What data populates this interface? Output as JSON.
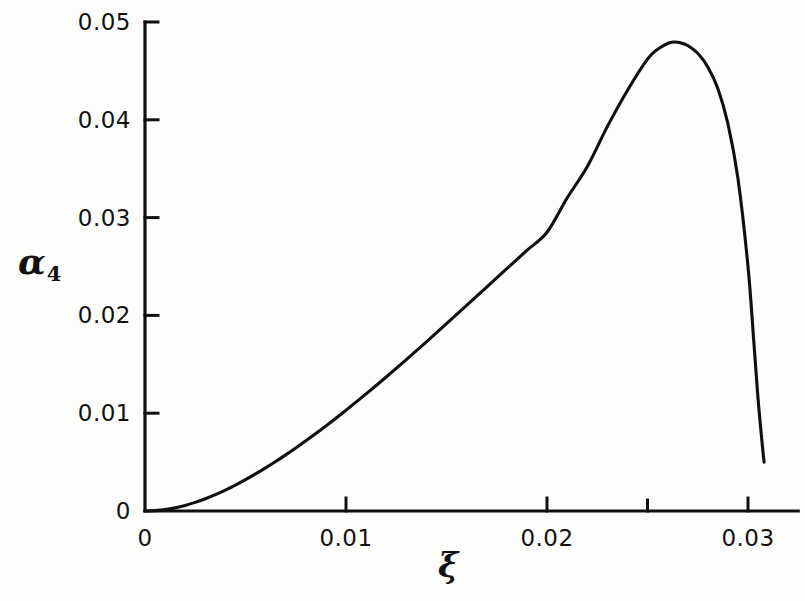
{
  "chart_data": {
    "type": "line",
    "title": "",
    "subtitle": "",
    "xlabel": "ξ",
    "ylabel": "α₄",
    "xlim": [
      0,
      0.0325
    ],
    "ylim": [
      0,
      0.05
    ],
    "grid": false,
    "legend": null,
    "x_ticks": [
      {
        "value": 0,
        "label": "0",
        "major": true
      },
      {
        "value": 0.01,
        "label": "0.01",
        "major": true
      },
      {
        "value": 0.02,
        "label": "0.02",
        "major": true
      },
      {
        "value": 0.025,
        "label": "",
        "major": false
      },
      {
        "value": 0.03,
        "label": "0.03",
        "major": true
      }
    ],
    "y_ticks": [
      {
        "value": 0,
        "label": "0",
        "major": true
      },
      {
        "value": 0.01,
        "label": "0.01",
        "major": true
      },
      {
        "value": 0.02,
        "label": "0.02",
        "major": true
      },
      {
        "value": 0.03,
        "label": "0.03",
        "major": true
      },
      {
        "value": 0.04,
        "label": "0.04",
        "major": true
      },
      {
        "value": 0.05,
        "label": "0.05",
        "major": true
      }
    ],
    "series": [
      {
        "name": "alpha_4",
        "x": [
          0.0,
          0.0005,
          0.001,
          0.0015,
          0.002,
          0.0025,
          0.003,
          0.0035,
          0.004,
          0.0045,
          0.005,
          0.0055,
          0.006,
          0.0065,
          0.007,
          0.0075,
          0.008,
          0.0085,
          0.009,
          0.0095,
          0.01,
          0.011,
          0.012,
          0.013,
          0.014,
          0.015,
          0.016,
          0.017,
          0.018,
          0.019,
          0.02,
          0.021,
          0.022,
          0.023,
          0.024,
          0.025,
          0.0255,
          0.026,
          0.0263,
          0.0266,
          0.027,
          0.0275,
          0.028,
          0.0285,
          0.029,
          0.0295,
          0.03,
          0.0303,
          0.0305,
          0.0307,
          0.0308
        ],
        "y": [
          0.0,
          4e-05,
          0.00014,
          0.00032,
          0.00057,
          0.00088,
          0.00125,
          0.00167,
          0.00214,
          0.00265,
          0.0032,
          0.00379,
          0.00441,
          0.00506,
          0.00574,
          0.00645,
          0.00718,
          0.00793,
          0.0087,
          0.00949,
          0.0103,
          0.01197,
          0.0137,
          0.01548,
          0.0173,
          0.01915,
          0.02102,
          0.0229,
          0.02478,
          0.02665,
          0.0285,
          0.032,
          0.0352,
          0.0393,
          0.043,
          0.0462,
          0.0472,
          0.0478,
          0.04795,
          0.0479,
          0.0476,
          0.0468,
          0.0454,
          0.0432,
          0.0396,
          0.034,
          0.025,
          0.017,
          0.0115,
          0.007,
          0.005
        ]
      }
    ],
    "annotations": [],
    "peak": {
      "x": 0.0263,
      "y": 0.048
    },
    "endpoint": {
      "x": 0.0308,
      "y": 0.005
    },
    "colors": {
      "curve": "#101010",
      "axis": "#101010",
      "background": "#fdfdfc"
    }
  },
  "axes": {
    "origin_px": {
      "x": 145,
      "y": 511
    },
    "x_px_per_unit": 20100,
    "y_px_per_unit": 9780
  }
}
